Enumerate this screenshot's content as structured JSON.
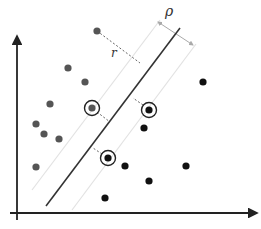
{
  "diagram": {
    "title": "",
    "type": "svm-margin",
    "labels": {
      "margin_width": "ρ",
      "distance": "r"
    },
    "colors": {
      "axis": "#222222",
      "hyperplane": "#333333",
      "margin_lines": "#dddddd",
      "dashed": "#666666",
      "class_a": "#555555",
      "class_b": "#111111",
      "support_ring": "#222222",
      "rho_arrow": "#aaaaaa"
    },
    "axes": {
      "origin": [
        17,
        213
      ],
      "y_top": [
        17,
        35
      ],
      "x_right": [
        259,
        213
      ]
    },
    "hyperplane": {
      "from": [
        46,
        206
      ],
      "to": [
        180,
        28
      ]
    },
    "class_a_points": [
      [
        97,
        31
      ],
      [
        68,
        68
      ],
      [
        85,
        82
      ],
      [
        50,
        104
      ],
      [
        36,
        124
      ],
      [
        44,
        134
      ],
      [
        59,
        139
      ],
      [
        36,
        167
      ]
    ],
    "class_b_points": [
      [
        203,
        82
      ],
      [
        144,
        128
      ],
      [
        125,
        166
      ],
      [
        186,
        166
      ],
      [
        149,
        181
      ],
      [
        105,
        198
      ]
    ],
    "support_vectors": [
      {
        "class": "a",
        "pos": [
          92,
          108
        ]
      },
      {
        "class": "b",
        "pos": [
          149,
          110
        ]
      },
      {
        "class": "b",
        "pos": [
          108,
          158
        ]
      }
    ]
  }
}
